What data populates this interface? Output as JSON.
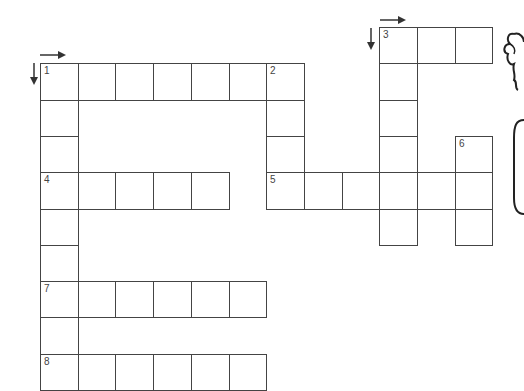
{
  "puzzle": {
    "type": "crossword",
    "grid": {
      "origin_x": 40,
      "origin_y": 27,
      "cell_w": 37.7,
      "cell_h": 36.3
    },
    "cells": [
      {
        "r": 0,
        "c": 9,
        "num": "3"
      },
      {
        "r": 0,
        "c": 10
      },
      {
        "r": 0,
        "c": 11
      },
      {
        "r": 1,
        "c": 0,
        "num": "1"
      },
      {
        "r": 1,
        "c": 1
      },
      {
        "r": 1,
        "c": 2
      },
      {
        "r": 1,
        "c": 3
      },
      {
        "r": 1,
        "c": 4
      },
      {
        "r": 1,
        "c": 5
      },
      {
        "r": 1,
        "c": 6,
        "num": "2"
      },
      {
        "r": 1,
        "c": 9
      },
      {
        "r": 2,
        "c": 0
      },
      {
        "r": 2,
        "c": 6
      },
      {
        "r": 2,
        "c": 9
      },
      {
        "r": 3,
        "c": 0
      },
      {
        "r": 3,
        "c": 6
      },
      {
        "r": 3,
        "c": 9
      },
      {
        "r": 3,
        "c": 11,
        "num": "6"
      },
      {
        "r": 4,
        "c": 0,
        "num": "4"
      },
      {
        "r": 4,
        "c": 1
      },
      {
        "r": 4,
        "c": 2
      },
      {
        "r": 4,
        "c": 3
      },
      {
        "r": 4,
        "c": 4
      },
      {
        "r": 4,
        "c": 6,
        "num": "5"
      },
      {
        "r": 4,
        "c": 7
      },
      {
        "r": 4,
        "c": 8
      },
      {
        "r": 4,
        "c": 9
      },
      {
        "r": 4,
        "c": 10
      },
      {
        "r": 4,
        "c": 11
      },
      {
        "r": 5,
        "c": 0
      },
      {
        "r": 5,
        "c": 9
      },
      {
        "r": 5,
        "c": 11
      },
      {
        "r": 6,
        "c": 0
      },
      {
        "r": 7,
        "c": 0,
        "num": "7"
      },
      {
        "r": 7,
        "c": 1
      },
      {
        "r": 7,
        "c": 2
      },
      {
        "r": 7,
        "c": 3
      },
      {
        "r": 7,
        "c": 4
      },
      {
        "r": 7,
        "c": 5
      },
      {
        "r": 8,
        "c": 0
      },
      {
        "r": 9,
        "c": 0,
        "num": "8"
      },
      {
        "r": 9,
        "c": 1
      },
      {
        "r": 9,
        "c": 2
      },
      {
        "r": 9,
        "c": 3
      },
      {
        "r": 9,
        "c": 4
      },
      {
        "r": 9,
        "c": 5
      }
    ],
    "entries": [
      {
        "number": "1",
        "direction": "across",
        "length": 6
      },
      {
        "number": "1",
        "direction": "down",
        "length": 9
      },
      {
        "number": "2",
        "direction": "down",
        "length": 4
      },
      {
        "number": "3",
        "direction": "across",
        "length": 3
      },
      {
        "number": "3",
        "direction": "down",
        "length": 6
      },
      {
        "number": "4",
        "direction": "across",
        "length": 5
      },
      {
        "number": "5",
        "direction": "across",
        "length": 6
      },
      {
        "number": "6",
        "direction": "down",
        "length": 3
      },
      {
        "number": "7",
        "direction": "across",
        "length": 6
      },
      {
        "number": "8",
        "direction": "across",
        "length": 6
      }
    ],
    "direction_arrows": [
      {
        "at": "1",
        "kind": "across-arrow"
      },
      {
        "at": "1",
        "kind": "down-arrow"
      },
      {
        "at": "3",
        "kind": "across-arrow"
      },
      {
        "at": "3",
        "kind": "down-arrow"
      }
    ]
  },
  "colors": {
    "line": "#444444",
    "background": "#ffffff"
  }
}
